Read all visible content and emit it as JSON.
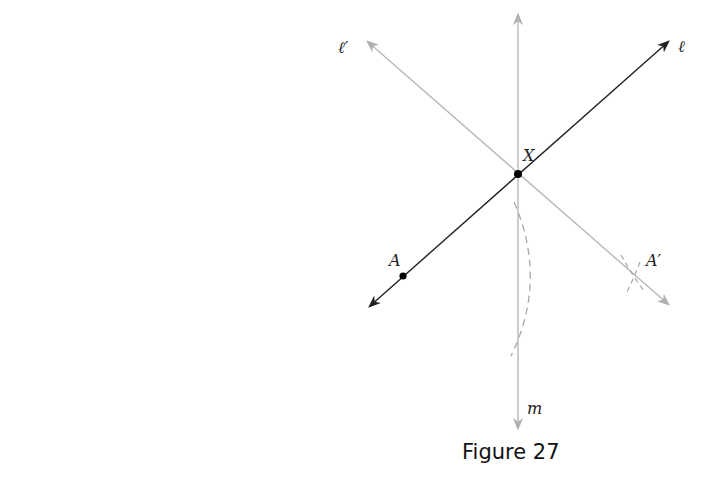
{
  "figure": {
    "caption": "Figure 27",
    "labels": {
      "line_l": "ℓ",
      "line_l_prime": "ℓ′",
      "line_m": "m",
      "point_X": "X",
      "point_A": "A",
      "point_A_prime": "A′"
    },
    "colors": {
      "dark_line": "#222222",
      "light_line": "#b0b0b0",
      "dashed_arc": "#a8a8a8",
      "point": "#000000"
    }
  }
}
